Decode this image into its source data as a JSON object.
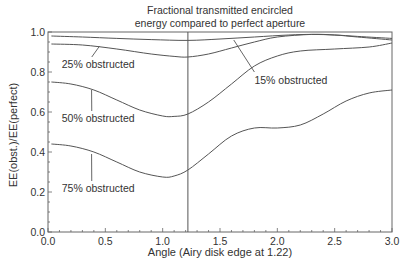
{
  "chart_data": {
    "type": "line",
    "title": "Fractional transmitted encircled energy compared to perfect aperture",
    "title_lines": [
      "Fractional transmitted encircled",
      "energy compared to perfect aperture"
    ],
    "xlabel": "Angle (Airy disk edge at 1.22)",
    "ylabel": "EE(obst.)/EE(perfect)",
    "xlim": [
      0.0,
      3.0
    ],
    "ylim": [
      0.0,
      1.0
    ],
    "xticks": [
      "0.0",
      "0.5",
      "1.0",
      "1.5",
      "2.0",
      "2.5",
      "3.0"
    ],
    "yticks": [
      "0.0",
      "0.2",
      "0.4",
      "0.6",
      "0.8",
      "1.0"
    ],
    "grid": false,
    "legend": "inline annotations",
    "vertical_marker": {
      "x": 1.22,
      "label": "Airy disk edge"
    },
    "series": [
      {
        "name": "15% obstructed",
        "x": [
          0.03,
          0.3,
          0.6,
          0.9,
          1.22,
          1.5,
          1.8,
          2.1,
          2.3,
          2.5,
          2.7,
          3.0
        ],
        "values": [
          0.98,
          0.975,
          0.968,
          0.962,
          0.958,
          0.965,
          0.975,
          0.985,
          0.988,
          0.985,
          0.978,
          0.968
        ]
      },
      {
        "name": "25% obstructed",
        "x": [
          0.03,
          0.3,
          0.6,
          0.9,
          1.1,
          1.22,
          1.4,
          1.6,
          1.8,
          2.0,
          2.3,
          2.5,
          2.7,
          3.0
        ],
        "values": [
          0.94,
          0.935,
          0.915,
          0.89,
          0.878,
          0.875,
          0.89,
          0.92,
          0.95,
          0.975,
          0.988,
          0.985,
          0.975,
          0.96
        ]
      },
      {
        "name": "50% obstructed",
        "x": [
          0.03,
          0.2,
          0.4,
          0.6,
          0.8,
          1.0,
          1.1,
          1.22,
          1.4,
          1.6,
          1.8,
          2.0,
          2.2,
          2.5,
          2.8,
          3.0
        ],
        "values": [
          0.75,
          0.74,
          0.71,
          0.66,
          0.61,
          0.58,
          0.578,
          0.59,
          0.65,
          0.74,
          0.83,
          0.88,
          0.905,
          0.915,
          0.925,
          0.945
        ]
      },
      {
        "name": "75% obstructed",
        "x": [
          0.03,
          0.2,
          0.4,
          0.6,
          0.8,
          1.0,
          1.1,
          1.22,
          1.4,
          1.6,
          1.8,
          2.0,
          2.2,
          2.4,
          2.6,
          2.8,
          3.0
        ],
        "values": [
          0.44,
          0.43,
          0.4,
          0.35,
          0.3,
          0.275,
          0.28,
          0.31,
          0.39,
          0.48,
          0.52,
          0.52,
          0.535,
          0.59,
          0.655,
          0.695,
          0.71
        ]
      }
    ],
    "annotations": [
      {
        "text": "25% obstructed",
        "label_xy": [
          0.12,
          0.82
        ],
        "arrow_to": [
          0.45,
          0.93
        ]
      },
      {
        "text": "15% obstructed",
        "label_xy": [
          1.8,
          0.74
        ],
        "arrow_to": [
          1.62,
          0.96
        ]
      },
      {
        "text": "50% obstructed",
        "label_xy": [
          0.12,
          0.55
        ],
        "arrow_to": [
          0.38,
          0.71
        ]
      },
      {
        "text": "75% obstructed",
        "label_xy": [
          0.12,
          0.2
        ],
        "arrow_to": [
          0.38,
          0.39
        ]
      }
    ]
  },
  "style": {
    "line_color": "#555555",
    "axis_color": "#666666",
    "text_color": "#333333",
    "background": "#ffffff"
  }
}
